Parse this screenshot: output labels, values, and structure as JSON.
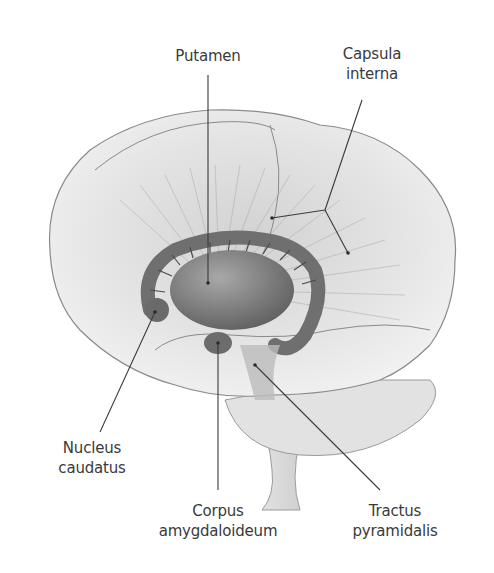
{
  "figure": {
    "labels": {
      "putamen": "Putamen",
      "capsula_line1": "Capsula",
      "capsula_line2": "interna",
      "nucleus_line1": "Nucleus",
      "nucleus_line2": "caudatus",
      "corpus_line1": "Corpus",
      "corpus_line2": "amygdaloideum",
      "tractus_line1": "Tractus",
      "tractus_line2": "pyramidalis"
    },
    "colors": {
      "background": "#ffffff",
      "cortex": "#e6e6e6",
      "cortex_outline": "#8a8a8a",
      "basal_ganglia": "#7d7d7d",
      "leader_line": "#3a3a3a",
      "label_text": "#3a3a3a"
    }
  }
}
